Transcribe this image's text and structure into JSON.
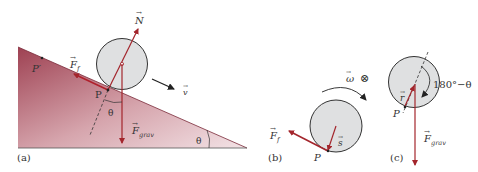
{
  "colors": {
    "arrow_red": "#a3252c",
    "wedge_dark": "#9e4152",
    "wedge_light": "#f1dde0",
    "disk_fill": "#dfe0e1",
    "outline": "#333333"
  },
  "panels": {
    "a": {
      "label": "(a)",
      "points": {
        "p": "P",
        "p_prime": "P′"
      },
      "vectors": {
        "normal": "N",
        "friction": "F",
        "friction_sub": "f",
        "gravity": "F",
        "gravity_sub": "grav",
        "velocity": "v"
      },
      "angles": {
        "at_contact": "θ",
        "at_base": "θ"
      }
    },
    "b": {
      "label": "(b)",
      "points": {
        "p": "P"
      },
      "vectors": {
        "angular_velocity": "ω",
        "into_page_symbol": "⊗",
        "friction": "F",
        "friction_sub": "f",
        "position": "s"
      }
    },
    "c": {
      "label": "(c)",
      "points": {
        "p": "P"
      },
      "vectors": {
        "position": "r",
        "gravity": "F",
        "gravity_sub": "grav"
      },
      "angles": {
        "between": "180°−θ"
      }
    }
  }
}
